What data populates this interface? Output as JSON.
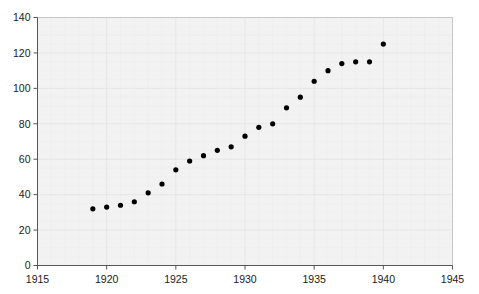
{
  "chart": {
    "title": "",
    "background_color": "#ffffff",
    "plot_background_color": "#f2f2f2",
    "point_color": "#000000"
  },
  "chart_data": {
    "type": "scatter",
    "title": "",
    "subtitle": "",
    "xlabel": "",
    "ylabel": "",
    "xlim": [
      1915,
      1945
    ],
    "ylim": [
      0,
      140
    ],
    "xticks": [
      1915,
      1920,
      1925,
      1930,
      1935,
      1940,
      1945
    ],
    "yticks": [
      0,
      20,
      40,
      60,
      80,
      100,
      120,
      140
    ],
    "xtick_labels": [
      "1915",
      "1920",
      "1925",
      "1930",
      "1935",
      "1940",
      "1945"
    ],
    "ytick_labels": [
      "0",
      "20",
      "40",
      "60",
      "80",
      "100",
      "120",
      "140"
    ],
    "grid": true,
    "legend": null,
    "legend_position": "none",
    "annotations": [],
    "series": [
      {
        "name": "",
        "marker": "circle",
        "color": "#000000",
        "x": [
          1919,
          1920,
          1921,
          1922,
          1923,
          1924,
          1925,
          1926,
          1927,
          1928,
          1929,
          1930,
          1931,
          1932,
          1933,
          1934,
          1935,
          1936,
          1937,
          1938,
          1939,
          1940
        ],
        "y": [
          32,
          33,
          34,
          36,
          41,
          46,
          54,
          59,
          62,
          65,
          67,
          73,
          78,
          80,
          89,
          95,
          104,
          110,
          114,
          115,
          115,
          125
        ],
        "points": [
          {
            "x": 1919,
            "y": 32
          },
          {
            "x": 1920,
            "y": 33
          },
          {
            "x": 1921,
            "y": 34
          },
          {
            "x": 1922,
            "y": 36
          },
          {
            "x": 1923,
            "y": 41
          },
          {
            "x": 1924,
            "y": 46
          },
          {
            "x": 1925,
            "y": 54
          },
          {
            "x": 1926,
            "y": 59
          },
          {
            "x": 1927,
            "y": 62
          },
          {
            "x": 1928,
            "y": 65
          },
          {
            "x": 1929,
            "y": 67
          },
          {
            "x": 1930,
            "y": 73
          },
          {
            "x": 1931,
            "y": 78
          },
          {
            "x": 1932,
            "y": 80
          },
          {
            "x": 1933,
            "y": 89
          },
          {
            "x": 1934,
            "y": 95
          },
          {
            "x": 1935,
            "y": 104
          },
          {
            "x": 1936,
            "y": 110
          },
          {
            "x": 1937,
            "y": 114
          },
          {
            "x": 1938,
            "y": 115
          },
          {
            "x": 1939,
            "y": 115
          },
          {
            "x": 1940,
            "y": 125
          }
        ]
      }
    ]
  }
}
